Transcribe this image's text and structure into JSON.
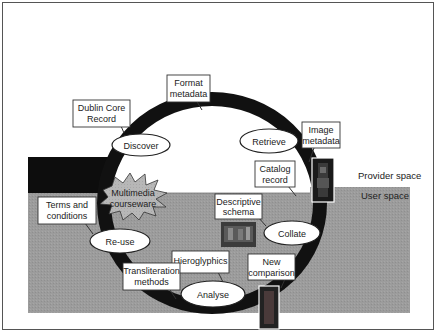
{
  "diagram": {
    "type": "lifecycle-cycle",
    "regions": {
      "provider_space": "Provider space",
      "user_space": "User space"
    },
    "cycle_stages": [
      {
        "id": "discover",
        "label": "Discover"
      },
      {
        "id": "retrieve",
        "label": "Retrieve"
      },
      {
        "id": "collate",
        "label": "Collate"
      },
      {
        "id": "analyse",
        "label": "Analyse"
      },
      {
        "id": "re-use",
        "label": "Re-use"
      }
    ],
    "callouts": [
      {
        "id": "dublin-core-record",
        "lines": [
          "Dublin Core",
          "Record"
        ],
        "points_to": "discover"
      },
      {
        "id": "format-metadata",
        "lines": [
          "Format",
          "metadata"
        ],
        "points_to": "ring"
      },
      {
        "id": "image-metadata",
        "lines": [
          "Image",
          "metadata"
        ],
        "points_to": "image-1"
      },
      {
        "id": "catalog-record",
        "lines": [
          "Catalog",
          "record"
        ],
        "points_to": "ring"
      },
      {
        "id": "descriptive-schema",
        "lines": [
          "Descriptive",
          "schema"
        ],
        "points_to": "collate"
      },
      {
        "id": "new-comparison",
        "lines": [
          "New",
          "comparison"
        ],
        "points_to": "ring"
      },
      {
        "id": "hieroglyphics",
        "lines": [
          "Hieroglyphics"
        ],
        "points_to": "analyse"
      },
      {
        "id": "transliteration-methods",
        "lines": [
          "Transliteration",
          "methods"
        ],
        "points_to": "ring"
      },
      {
        "id": "terms-and-conditions",
        "lines": [
          "Terms and",
          "conditions"
        ],
        "points_to": "re-use"
      }
    ],
    "burst": {
      "id": "multimedia-courseware",
      "lines": [
        "Multimedia",
        "courseware"
      ]
    },
    "images": [
      {
        "id": "image-1",
        "description": "tall artifact photo near Image metadata"
      },
      {
        "id": "image-2",
        "description": "scene photo under Descriptive schema"
      },
      {
        "id": "image-3",
        "description": "tall statue photo under New comparison"
      }
    ],
    "colors": {
      "ring": "#111111",
      "user_space": "#9a9a9a",
      "block": "#0d0d0d",
      "burst": "#b4b4b4",
      "frame": "#555555"
    }
  }
}
